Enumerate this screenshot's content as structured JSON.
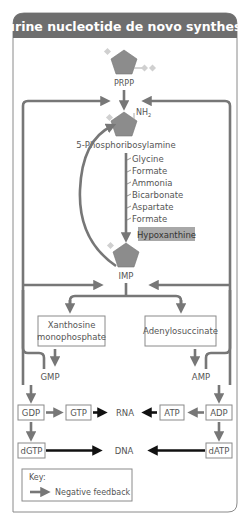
{
  "title": "Purine nucleotide de novo synthesis",
  "colors": {
    "header": "#6e6e6e",
    "pentagon": "#8c8c8c",
    "feedback_arrow": "#777777",
    "synthesis_arrow": "#111111",
    "hypoxanthine_bg": "#a8a8a8"
  },
  "nodes": {
    "prpp": "PRPP",
    "nh2": "NH",
    "nh2_sub": "2",
    "phosphoribosylamine": "5-Phosphoribosylamine",
    "hypoxanthine": "Hypoxanthine",
    "imp": "IMP",
    "xmp_line1": "Xanthosine",
    "xmp_line2": "monophosphate",
    "adenylosuccinate": "Adenylosuccinate",
    "gmp": "GMP",
    "amp": "AMP",
    "gdp": "GDP",
    "gtp": "GTP",
    "rna": "RNA",
    "atp": "ATP",
    "adp": "ADP",
    "dgtp": "dGTP",
    "dna": "DNA",
    "datp": "dATP"
  },
  "inputs": [
    "Glycine",
    "Formate",
    "Ammonia",
    "Bicarbonate",
    "Aspartate",
    "Formate"
  ],
  "key": {
    "title": "Key:",
    "negative_feedback": "Negative feedback"
  }
}
